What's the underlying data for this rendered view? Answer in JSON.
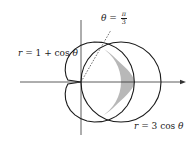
{
  "diagram": {
    "type": "polar-curves",
    "labels": {
      "cardioid": {
        "lhs": "r",
        "eq": " = 1 + cos ",
        "var": "θ"
      },
      "circle": {
        "lhs": "r",
        "eq": " = 3 cos ",
        "var": "θ"
      },
      "angle": {
        "var": "θ",
        "eq": " = ",
        "num": "π",
        "den": "3"
      }
    },
    "curves": [
      {
        "name": "cardioid",
        "equation": "r = 1 + cos θ"
      },
      {
        "name": "circle",
        "equation": "r = 3 cos θ"
      }
    ],
    "intersection_angle": "θ = π/3",
    "shaded_region": "inside r = 3 cos θ, outside r = 1 + cos θ, for -π/3 ≤ θ ≤ π/3",
    "colors": {
      "stroke": "#1a1a1a",
      "shade": "#b8b8b8",
      "axis": "#333333"
    }
  }
}
